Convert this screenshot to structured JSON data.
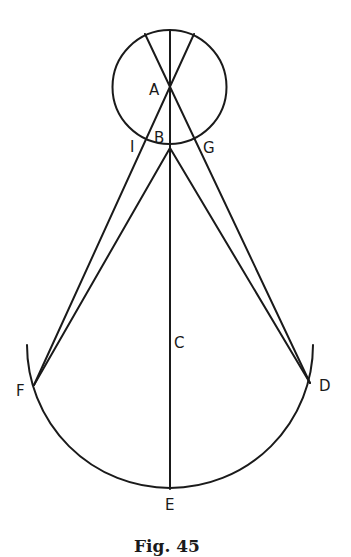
{
  "figure": {
    "caption": "Fig. 45",
    "labels": {
      "A": "A",
      "B": "B",
      "C": "C",
      "D": "D",
      "E": "E",
      "F": "F",
      "G": "G",
      "I": "I"
    },
    "colors": {
      "ink": "#1a1a1a",
      "background": "#ffffff"
    }
  }
}
